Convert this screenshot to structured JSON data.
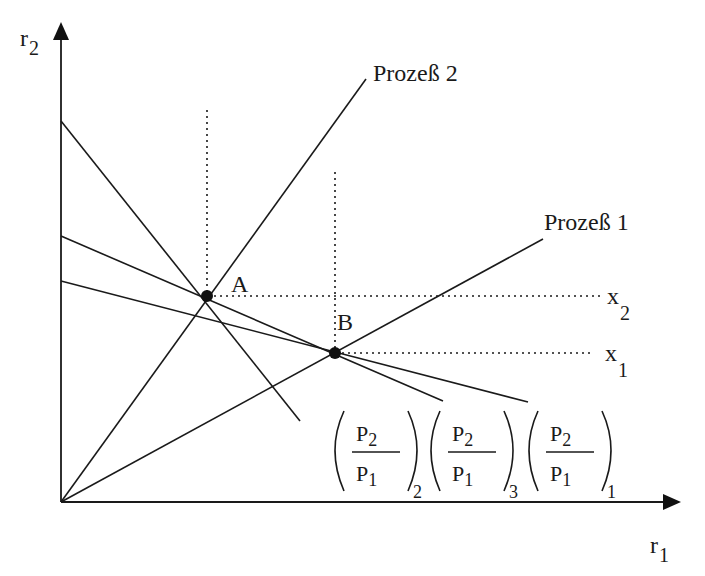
{
  "axes": {
    "y_label": "r",
    "y_sub": "2",
    "x_label": "r",
    "x_sub": "1"
  },
  "processes": [
    {
      "label": "Prozeß 2"
    },
    {
      "label": "Prozeß 1"
    }
  ],
  "points": [
    {
      "label": "A"
    },
    {
      "label": "B"
    }
  ],
  "isoquants": [
    {
      "label": "x",
      "sub": "2"
    },
    {
      "label": "x",
      "sub": "1"
    }
  ],
  "price_ratios": [
    {
      "num": "P",
      "num_sub": "2",
      "den": "P",
      "den_sub": "1",
      "index": "2"
    },
    {
      "num": "P",
      "num_sub": "2",
      "den": "P",
      "den_sub": "1",
      "index": "3"
    },
    {
      "num": "P",
      "num_sub": "2",
      "den": "P",
      "den_sub": "1",
      "index": "1"
    }
  ],
  "colors": {
    "ink": "#1a1a1a",
    "background": "#ffffff"
  }
}
